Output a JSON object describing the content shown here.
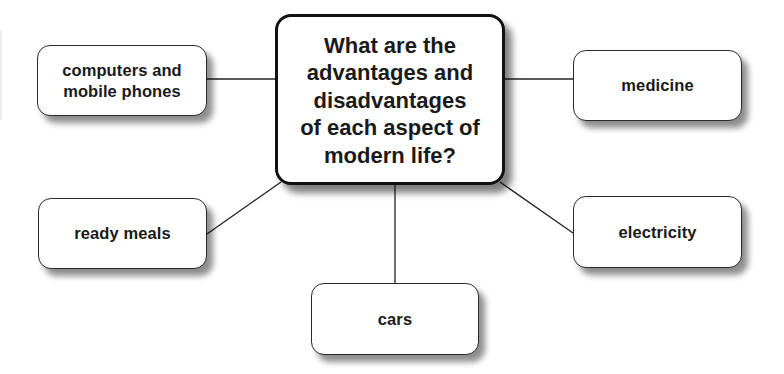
{
  "diagram": {
    "type": "mind-map",
    "center": {
      "label": "What are the advantages and disadvantages of each aspect of modern life?",
      "lines": [
        "What are the",
        "advantages and",
        "disadvantages",
        "of each aspect of",
        "modern life?"
      ]
    },
    "nodes": [
      {
        "id": "computers",
        "lines": [
          "computers and",
          "mobile phones"
        ]
      },
      {
        "id": "medicine",
        "lines": [
          "medicine"
        ]
      },
      {
        "id": "ready-meals",
        "lines": [
          "ready meals"
        ]
      },
      {
        "id": "electricity",
        "lines": [
          "electricity"
        ]
      },
      {
        "id": "cars",
        "lines": [
          "cars"
        ]
      }
    ],
    "colors": {
      "border": "#2a2a2a",
      "text": "#1a1a1a",
      "background": "#ffffff",
      "connector": "#222222"
    }
  }
}
